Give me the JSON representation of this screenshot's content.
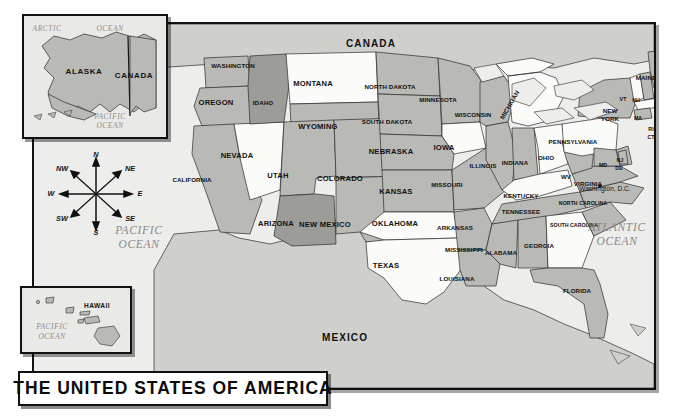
{
  "title": {
    "text": "THE UNITED STATES OF AMERICA"
  },
  "countries": [
    {
      "name": "CANADA",
      "x": 371,
      "y": 44
    },
    {
      "name": "MEXICO",
      "x": 345,
      "y": 338
    }
  ],
  "oceans": [
    {
      "name": "PACIFIC",
      "x": 139,
      "y": 231
    },
    {
      "name": "OCEAN",
      "x": 139,
      "y": 245
    },
    {
      "name": "ATLANTIC",
      "x": 617,
      "y": 228
    },
    {
      "name": "OCEAN",
      "x": 617,
      "y": 242
    }
  ],
  "insets": {
    "alaska": {
      "name": "alaska-inset",
      "labels": [
        {
          "text": "ALASKA",
          "x": 84,
          "y": 72,
          "cls": "inset-st"
        },
        {
          "text": "CANADA",
          "x": 134,
          "y": 76,
          "cls": "inset-st"
        },
        {
          "text": "ARCTIC",
          "x": 47,
          "y": 29,
          "cls": "ocean-sm"
        },
        {
          "text": "OCEAN",
          "x": 110,
          "y": 29,
          "cls": "ocean-sm"
        },
        {
          "text": "PACIFIC",
          "x": 110,
          "y": 117,
          "cls": "ocean-sm"
        },
        {
          "text": "OCEAN",
          "x": 110,
          "y": 126,
          "cls": "ocean-sm"
        }
      ]
    },
    "hawaii": {
      "name": "hawaii-inset",
      "labels": [
        {
          "text": "HAWAII",
          "x": 97,
          "y": 306,
          "cls": "inset-st-sm"
        },
        {
          "text": "PACIFIC",
          "x": 52,
          "y": 327,
          "cls": "ocean-sm"
        },
        {
          "text": "OCEAN",
          "x": 52,
          "y": 337,
          "cls": "ocean-sm"
        }
      ]
    }
  },
  "compass": {
    "name": "compass-rose",
    "directions": [
      {
        "text": "N",
        "x": 52,
        "y": 3
      },
      {
        "text": "NE",
        "x": 86,
        "y": 17
      },
      {
        "text": "E",
        "x": 96,
        "y": 42
      },
      {
        "text": "SE",
        "x": 86,
        "y": 67
      },
      {
        "text": "S",
        "x": 52,
        "y": 81
      },
      {
        "text": "SW",
        "x": 18,
        "y": 67
      },
      {
        "text": "W",
        "x": 7,
        "y": 42
      },
      {
        "text": "NW",
        "x": 18,
        "y": 17
      }
    ]
  },
  "capital": {
    "text": "Washington, D.C.",
    "x": 605,
    "y": 189
  },
  "states": [
    {
      "name": "WASHINGTON",
      "x": 233,
      "y": 66,
      "cls": "st-sm",
      "tone": "mid"
    },
    {
      "name": "OREGON",
      "x": 216,
      "y": 103,
      "cls": "st",
      "tone": "mid"
    },
    {
      "name": "IDAHO",
      "x": 263,
      "y": 103,
      "cls": "st-sm",
      "tone": "dark"
    },
    {
      "name": "MONTANA",
      "x": 313,
      "y": 84,
      "cls": "st",
      "tone": "light"
    },
    {
      "name": "NORTH DAKOTA",
      "x": 390,
      "y": 87,
      "cls": "st-sm",
      "tone": "mid"
    },
    {
      "name": "SOUTH DAKOTA",
      "x": 387,
      "y": 122,
      "cls": "st-sm",
      "tone": "mid"
    },
    {
      "name": "MINNESOTA",
      "x": 438,
      "y": 100,
      "cls": "st-sm",
      "tone": "mid"
    },
    {
      "name": "WISCONSIN",
      "x": 473,
      "y": 115,
      "cls": "st-sm",
      "tone": "mid"
    },
    {
      "name": "MICHIGAN",
      "x": 510,
      "y": 105,
      "cls": "st-sm",
      "tone": "light"
    },
    {
      "name": "WYOMING",
      "x": 318,
      "y": 127,
      "cls": "st",
      "tone": "mid"
    },
    {
      "name": "NEVADA",
      "x": 237,
      "y": 156,
      "cls": "st",
      "tone": "light"
    },
    {
      "name": "UTAH",
      "x": 278,
      "y": 176,
      "cls": "st",
      "tone": "mid"
    },
    {
      "name": "COLORADO",
      "x": 340,
      "y": 179,
      "cls": "st",
      "tone": "mid"
    },
    {
      "name": "NEBRASKA",
      "x": 391,
      "y": 152,
      "cls": "st",
      "tone": "mid"
    },
    {
      "name": "IOWA",
      "x": 444,
      "y": 148,
      "cls": "st",
      "tone": "light"
    },
    {
      "name": "ILLINOIS",
      "x": 483,
      "y": 166,
      "cls": "st-sm",
      "tone": "mid"
    },
    {
      "name": "INDIANA",
      "x": 515,
      "y": 163,
      "cls": "st-sm",
      "tone": "mid"
    },
    {
      "name": "OHIO",
      "x": 546,
      "y": 158,
      "cls": "st-sm",
      "tone": "light"
    },
    {
      "name": "CALIFORNIA",
      "x": 192,
      "y": 180,
      "cls": "st-sm",
      "tone": "mid"
    },
    {
      "name": "KANSAS",
      "x": 396,
      "y": 192,
      "cls": "st",
      "tone": "mid"
    },
    {
      "name": "MISSOURI",
      "x": 447,
      "y": 185,
      "cls": "st-sm",
      "tone": "mid"
    },
    {
      "name": "KENTUCKY",
      "x": 521,
      "y": 196,
      "cls": "st-sm",
      "tone": "light"
    },
    {
      "name": "ARIZONA",
      "x": 276,
      "y": 224,
      "cls": "st",
      "tone": "dark"
    },
    {
      "name": "NEW MEXICO",
      "x": 325,
      "y": 225,
      "cls": "st",
      "tone": "mid"
    },
    {
      "name": "OKLAHOMA",
      "x": 395,
      "y": 224,
      "cls": "st",
      "tone": "light"
    },
    {
      "name": "ARKANSAS",
      "x": 455,
      "y": 228,
      "cls": "st-sm",
      "tone": "mid"
    },
    {
      "name": "TENNESSEE",
      "x": 521,
      "y": 212,
      "cls": "st-sm",
      "tone": "mid"
    },
    {
      "name": "TEXAS",
      "x": 386,
      "y": 266,
      "cls": "st",
      "tone": "light"
    },
    {
      "name": "MISSISSIPPI",
      "x": 464,
      "y": 250,
      "cls": "st-sm",
      "tone": "mid"
    },
    {
      "name": "ALABAMA",
      "x": 501,
      "y": 253,
      "cls": "st-sm",
      "tone": "mid"
    },
    {
      "name": "GEORGIA",
      "x": 539,
      "y": 246,
      "cls": "st-sm",
      "tone": "light"
    },
    {
      "name": "LOUISIANA",
      "x": 457,
      "y": 279,
      "cls": "st-sm",
      "tone": "mid"
    },
    {
      "name": "FLORIDA",
      "x": 577,
      "y": 291,
      "cls": "st-sm",
      "tone": "mid"
    },
    {
      "name": "NORTH CAROLINA",
      "x": 583,
      "y": 204,
      "cls": "st-xs",
      "tone": "mid"
    },
    {
      "name": "SOUTH CAROLINA",
      "x": 574,
      "y": 226,
      "cls": "st-xs",
      "tone": "mid"
    },
    {
      "name": "VIRGINIA",
      "x": 588,
      "y": 184,
      "cls": "st-sm",
      "tone": "mid"
    },
    {
      "name": "WV",
      "x": 566,
      "y": 177,
      "cls": "st-sm",
      "tone": "mid"
    },
    {
      "name": "PENNSYLVANIA",
      "x": 573,
      "y": 142,
      "cls": "st-sm",
      "tone": "light"
    },
    {
      "name": "NEW",
      "x": 610,
      "y": 111,
      "cls": "st-sm",
      "tone": "mid"
    },
    {
      "name": "YORK",
      "x": 610,
      "y": 119,
      "cls": "st-sm",
      "tone": "mid"
    },
    {
      "name": "MAINE",
      "x": 646,
      "y": 78,
      "cls": "st-sm",
      "tone": "mid"
    },
    {
      "name": "VT",
      "x": 623,
      "y": 100,
      "cls": "st-xs",
      "tone": "light"
    },
    {
      "name": "NH",
      "x": 636,
      "y": 101,
      "cls": "st-xs",
      "tone": "mid"
    },
    {
      "name": "MA",
      "x": 638,
      "y": 119,
      "cls": "st-xs",
      "tone": "light"
    },
    {
      "name": "RI",
      "x": 651,
      "y": 130,
      "cls": "st-xs",
      "tone": "mid"
    },
    {
      "name": "CT",
      "x": 651,
      "y": 138,
      "cls": "st-xs",
      "tone": "mid"
    },
    {
      "name": "NJ",
      "x": 620,
      "y": 161,
      "cls": "st-xs",
      "tone": "mid"
    },
    {
      "name": "MD",
      "x": 603,
      "y": 166,
      "cls": "st-xs",
      "tone": "mid"
    },
    {
      "name": "DE",
      "x": 619,
      "y": 169,
      "cls": "st-xs",
      "tone": "mid"
    }
  ],
  "colors": {
    "ocean": "#ededeb",
    "land_light": "#fbfbfa",
    "land_mid": "#b9b9b6",
    "land_dark": "#9c9c99",
    "foreign": "#cfcfcc",
    "border": "#111111",
    "frame": "#111111"
  }
}
